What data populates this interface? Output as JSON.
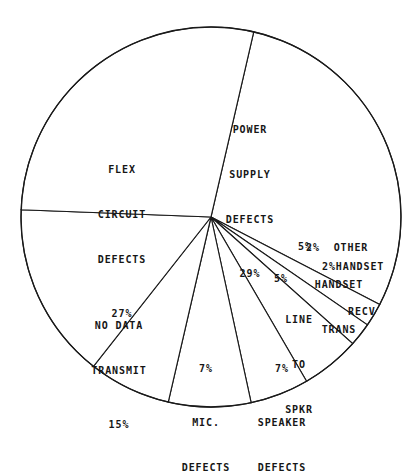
{
  "chart_data": {
    "type": "pie",
    "title": "",
    "subtitle": "",
    "xlabel": "",
    "ylabel": "",
    "legend_position": "none",
    "grid": false,
    "value_unit": "%",
    "total_label": "99%",
    "categories": [
      "POWER SUPPLY DEFECTS",
      "OTHER",
      "HANDSET RECV",
      "HANDSET TRANS",
      "LINE TO SPKR",
      "SPEAKER DEFECTS",
      "MIC. DEFECTS",
      "NO DATA TRANSMIT",
      "FLEX CIRCUIT DEFECTS"
    ],
    "values": [
      29,
      2,
      2,
      5,
      5,
      7,
      7,
      15,
      27
    ],
    "slices": [
      {
        "id": "power",
        "value": 29,
        "pct_label": "29%",
        "start_deg": -77,
        "end_deg": 27.4
      },
      {
        "id": "other",
        "value": 2,
        "pct_label": "2%",
        "start_deg": 27.4,
        "end_deg": 34.6
      },
      {
        "id": "handset_recv",
        "value": 2,
        "pct_label": "2%",
        "start_deg": 34.6,
        "end_deg": 41.8
      },
      {
        "id": "handset_trans",
        "value": 5,
        "pct_label": "5%",
        "start_deg": 41.8,
        "end_deg": 59.8
      },
      {
        "id": "line_to_spkr",
        "value": 5,
        "pct_label": "5%",
        "start_deg": 59.8,
        "end_deg": 77.8
      },
      {
        "id": "speaker",
        "value": 7,
        "pct_label": "7%",
        "start_deg": 77.8,
        "end_deg": 103.0
      },
      {
        "id": "mic",
        "value": 7,
        "pct_label": "7%",
        "start_deg": 103.0,
        "end_deg": 128.2
      },
      {
        "id": "no_data",
        "value": 15,
        "pct_label": "15%",
        "start_deg": 128.2,
        "end_deg": 182.2
      },
      {
        "id": "flex",
        "value": 27,
        "pct_label": "27%",
        "start_deg": 182.2,
        "end_deg": 283.0
      }
    ],
    "colors": {
      "slice_fill": "#ffffff",
      "slice_stroke": "#1a1a1a",
      "background": "#ffffff",
      "text": "#161616"
    }
  },
  "labels": {
    "power": {
      "line1": "POWER",
      "line2": "SUPPLY",
      "line3": "DEFECTS",
      "pct": "29%"
    },
    "flex": {
      "line1": "FLEX",
      "line2": "CIRCUIT",
      "line3": "DEFECTS",
      "pct": "27%"
    },
    "no_data": {
      "line1": "NO DATA",
      "line2": "TRANSMIT",
      "pct": "15%"
    },
    "mic": {
      "line1": "MIC.",
      "line2": "DEFECTS",
      "pct": "7%"
    },
    "speaker": {
      "line1": "SPEAKER",
      "line2": "DEFECTS",
      "pct": "7%"
    },
    "line_to_spkr": {
      "line1": "LINE",
      "line2": "TO",
      "line3": "SPKR",
      "pct": "5%"
    },
    "handset_trans": {
      "line1": "HANDSET",
      "line2": "TRANS",
      "pct": "5%"
    },
    "handset_recv": {
      "line1": "2%HANDSET",
      "line2": "RECV"
    },
    "other": {
      "line1": "2%  OTHER"
    }
  }
}
